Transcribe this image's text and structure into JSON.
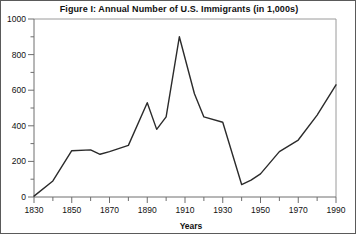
{
  "figure": {
    "title": "Figure I: Annual Number of U.S. Immigrants (in 1,000s)",
    "border_color": "#5a5a5a",
    "background_color": "#ffffff"
  },
  "chart_data": {
    "type": "line",
    "title": "Figure I: Annual Number of U.S. Immigrants (in 1,000s)",
    "xlabel": "Years",
    "ylabel": "",
    "xlim": [
      1830,
      1990
    ],
    "ylim": [
      0,
      1000
    ],
    "grid": false,
    "legend": null,
    "line_color": "#2b2b2b",
    "x_major_ticks": [
      1830,
      1850,
      1870,
      1890,
      1910,
      1930,
      1950,
      1970,
      1990
    ],
    "x_tick_labels": [
      "1830",
      "1850",
      "1870",
      "1890",
      "1910",
      "1930",
      "1950",
      "1970",
      "1990"
    ],
    "x_minor_tick_step": 10,
    "y_major_ticks": [
      0,
      200,
      400,
      600,
      800,
      1000
    ],
    "y_tick_labels": [
      "0",
      "200",
      "400",
      "600",
      "800",
      "1000"
    ],
    "y_minor_tick_step": 100,
    "series": [
      {
        "name": "Annual Number of U.S. Immigrants (in 1,000s)",
        "x": [
          1830,
          1840,
          1850,
          1860,
          1865,
          1870,
          1880,
          1890,
          1895,
          1900,
          1907,
          1915,
          1920,
          1930,
          1940,
          1945,
          1950,
          1960,
          1970,
          1980,
          1990
        ],
        "values": [
          5,
          90,
          260,
          265,
          240,
          255,
          290,
          530,
          380,
          450,
          900,
          580,
          450,
          420,
          70,
          95,
          130,
          255,
          320,
          460,
          630
        ]
      }
    ]
  },
  "axes": {
    "x_axis_label": "Years"
  }
}
